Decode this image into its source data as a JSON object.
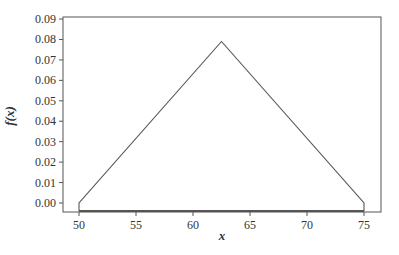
{
  "chart_data": {
    "type": "line",
    "title": "",
    "xlabel": "x",
    "ylabel": "f(x)",
    "xlim": [
      48.6,
      76.6
    ],
    "ylim": [
      -0.004,
      0.09
    ],
    "grid": false,
    "legend": null,
    "x_ticks": [
      50,
      55,
      60,
      65,
      70,
      75
    ],
    "y_ticks": [
      "0.00",
      "0.01",
      "0.02",
      "0.03",
      "0.04",
      "0.05",
      "0.06",
      "0.07",
      "0.08",
      "0.09"
    ],
    "series": [
      {
        "name": "triangular pdf",
        "x": [
          50,
          50,
          62.5,
          75,
          75
        ],
        "y": [
          -0.004,
          0.0,
          0.079,
          0.0,
          -0.004
        ]
      }
    ],
    "annotations": []
  },
  "colors": {
    "line": "#555555",
    "axis": "#555555",
    "text": "#333333"
  }
}
